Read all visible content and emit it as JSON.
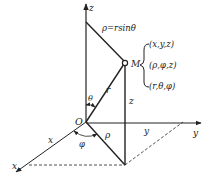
{
  "diagram": {
    "type": "spherical-cylindrical-coordinate-diagram",
    "axes": {
      "z_label": "z",
      "y_label": "y",
      "x_label": "x"
    },
    "origin_label": "O",
    "point_label": "M",
    "formula": "ρ=rsinθ",
    "coordinate_sets": [
      "(x,y,z)",
      "(ρ,φ,z)",
      "(r,θ,φ)"
    ],
    "segment_labels": {
      "r": "r",
      "rho": "ρ",
      "z": "z",
      "x": "x",
      "y": "y"
    },
    "angle_labels": {
      "theta": "θ",
      "phi": "φ"
    },
    "colors": {
      "line": "#222222",
      "background": "#ffffff"
    }
  }
}
